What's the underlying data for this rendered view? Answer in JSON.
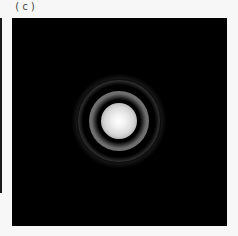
{
  "figure": {
    "panel_label": "(c)",
    "colors": {
      "background": "#000000",
      "page": "#f7f7f7",
      "center": "#ffffff"
    }
  }
}
